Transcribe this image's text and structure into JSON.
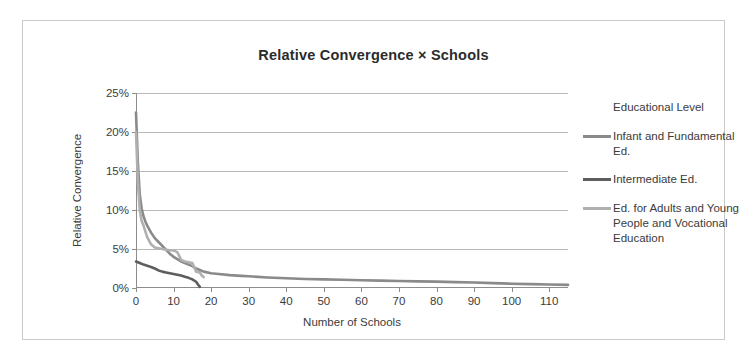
{
  "chart_data": {
    "type": "line",
    "title": "Relative Convergence  ×  Schools",
    "xlabel": "Number of Schools",
    "ylabel": "Relative Convergence",
    "xlim": [
      0,
      115
    ],
    "ylim": [
      0,
      25
    ],
    "grid": true,
    "legend_position": "right",
    "legend_title": "Educational Level",
    "y_tick_labels": [
      "0%",
      "5%",
      "10%",
      "15%",
      "20%",
      "25%"
    ],
    "y_tick_values": [
      0,
      5,
      10,
      15,
      20,
      25
    ],
    "x_tick_labels": [
      "0",
      "10",
      "20",
      "30",
      "40",
      "50",
      "60",
      "70",
      "80",
      "90",
      "100",
      "110"
    ],
    "x_tick_values": [
      0,
      10,
      20,
      30,
      40,
      50,
      60,
      70,
      80,
      90,
      100,
      110
    ],
    "series": [
      {
        "name": "Infant and Fundamental Ed.",
        "color": "#8a8a8a",
        "x": [
          0,
          0.5,
          1,
          1.5,
          2,
          2.5,
          3,
          4,
          5,
          6,
          7,
          8,
          9,
          10,
          11,
          12,
          13,
          14,
          15,
          16,
          17,
          18,
          20,
          22,
          25,
          28,
          30,
          35,
          40,
          45,
          50,
          55,
          60,
          65,
          70,
          75,
          80,
          85,
          90,
          95,
          100,
          105,
          110,
          115
        ],
        "y": [
          22.5,
          16.0,
          12.0,
          10.2,
          9.2,
          8.5,
          8.0,
          7.1,
          6.4,
          5.9,
          5.4,
          4.9,
          4.4,
          4.0,
          3.7,
          3.4,
          3.2,
          3.0,
          2.8,
          2.5,
          2.3,
          2.1,
          1.9,
          1.8,
          1.65,
          1.55,
          1.5,
          1.35,
          1.25,
          1.15,
          1.1,
          1.05,
          1.0,
          0.95,
          0.9,
          0.85,
          0.82,
          0.75,
          0.7,
          0.62,
          0.55,
          0.5,
          0.45,
          0.4
        ]
      },
      {
        "name": "Intermediate Ed.",
        "color": "#5e5e5e",
        "x": [
          0,
          1,
          2,
          3,
          4,
          5,
          6,
          7,
          8,
          9,
          10,
          11,
          12,
          13,
          14,
          15,
          16,
          16.5,
          17
        ],
        "y": [
          3.4,
          3.2,
          3.0,
          2.85,
          2.7,
          2.5,
          2.25,
          2.1,
          2.0,
          1.9,
          1.8,
          1.7,
          1.6,
          1.45,
          1.3,
          1.1,
          0.8,
          0.45,
          0.15
        ]
      },
      {
        "name": "Ed. for Adults and Young People and Vocational Education",
        "color": "#b0b0b0",
        "x": [
          0,
          0.5,
          1,
          1.5,
          2,
          3,
          4,
          5,
          6,
          7,
          8,
          9,
          10,
          11,
          12,
          13,
          14,
          15,
          16,
          17,
          17.5,
          18
        ],
        "y": [
          20.0,
          13.5,
          10.0,
          8.6,
          8.0,
          6.5,
          5.6,
          5.2,
          5.1,
          5.0,
          4.9,
          4.85,
          4.8,
          4.6,
          3.6,
          3.4,
          3.3,
          3.2,
          2.1,
          2.0,
          1.6,
          1.4
        ]
      }
    ]
  },
  "legend": {
    "title": "Educational Level",
    "items": [
      {
        "label": "Infant and Fundamental Ed.",
        "color": "#8a8a8a"
      },
      {
        "label": "Intermediate Ed.",
        "color": "#5e5e5e"
      },
      {
        "label": "Ed. for Adults and Young People and Vocational Education",
        "color": "#b0b0b0"
      }
    ]
  }
}
